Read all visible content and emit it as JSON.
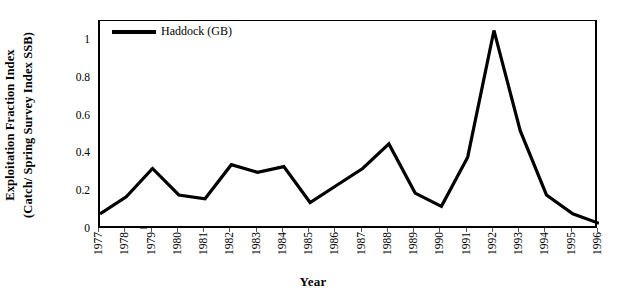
{
  "chart_data": {
    "type": "line",
    "title": "",
    "xlabel": "Year",
    "ylabel": "Exploitation Fraction Index (Catch/ Spring Survey Index SSB)",
    "ylabel_line1": "Exploitation Fraction Index",
    "ylabel_line2": "(Catch/ Spring Survey Index SSB)",
    "legend": [
      "Haddock (GB)"
    ],
    "legend_position": "top-left-inside",
    "grid": false,
    "line_color": "#000000",
    "xlim": [
      1977,
      1996
    ],
    "ylim": [
      0,
      1.1
    ],
    "yticks": [
      0,
      0.2,
      0.4,
      0.6,
      0.8,
      1
    ],
    "ytick_labels": [
      "0",
      "0.2",
      "0.4",
      "0.6",
      "0.8",
      "1"
    ],
    "categories": [
      "1977",
      "1978",
      "1979",
      "1980",
      "1981",
      "1982",
      "1983",
      "1984",
      "1985",
      "1986",
      "1987",
      "1988",
      "1989",
      "1990",
      "1991",
      "1992",
      "1993",
      "1994",
      "1995",
      "1996"
    ],
    "series": [
      {
        "name": "Haddock (GB)",
        "values": [
          0.08,
          0.17,
          0.32,
          0.18,
          0.16,
          0.34,
          0.3,
          0.33,
          0.14,
          0.23,
          0.32,
          0.45,
          0.19,
          0.12,
          0.38,
          1.05,
          0.52,
          0.18,
          0.08,
          0.03
        ]
      }
    ]
  },
  "axes": {
    "x_title": "Year",
    "y_title_line1": "Exploitation Fraction Index",
    "y_title_line2": "(Catch/ Spring Survey Index SSB)"
  },
  "legend": {
    "entry_label": "Haddock (GB)"
  }
}
